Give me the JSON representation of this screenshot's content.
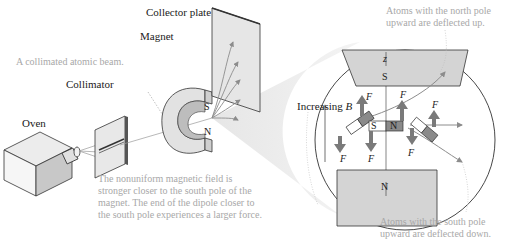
{
  "labels": {
    "collector_plate": "Collector plate",
    "magnet": "Magnet",
    "collimator": "Collimator",
    "oven": "Oven",
    "beam_note": "A collimated atomic beam.",
    "increasing_b_prefix": "Increasing ",
    "increasing_b_var": "B"
  },
  "notes": {
    "north_up": [
      "Atoms with the north pole",
      "upward are deflected up."
    ],
    "south_up": [
      "Atoms with the south pole",
      "upward are deflected down."
    ],
    "field": [
      "The nonuniform magnetic field is",
      "stronger closer to the south pole of the",
      "magnet. The end of the dipole closer to",
      "the south pole experiences a larger force."
    ]
  },
  "inset": {
    "axis_label": "z",
    "top_pole": "S",
    "bottom_pole": "N",
    "force_symbol": "F",
    "dipole_s": "S",
    "dipole_n": "N"
  },
  "magnet": {
    "south": "S",
    "north": "N"
  },
  "colors": {
    "gray_fill": "#d4d4d4",
    "dark_fill": "#8a8a8a",
    "arrow": "#8c8c8c",
    "note_text": "#a8a8a8"
  }
}
